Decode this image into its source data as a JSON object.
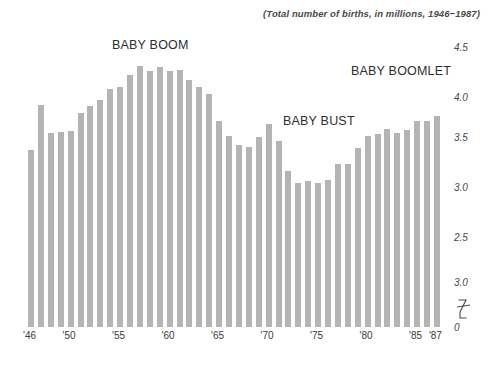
{
  "chart_data": {
    "type": "bar",
    "title": "",
    "subtitle": "(Total number of births, in millions, 1946−1987)",
    "xlabel": "",
    "ylabel": "",
    "ylim": [
      0,
      4.5
    ],
    "grid": false,
    "legend": null,
    "bar_color": "#b4b4b4",
    "background_color": "#ffffff",
    "axis_note": "y-axis is broken below the lowest labelled tick; the tick printed directly above the break reads '3.0' as rendered",
    "categories": [
      "1946",
      "1947",
      "1948",
      "1949",
      "1950",
      "1951",
      "1952",
      "1953",
      "1954",
      "1955",
      "1956",
      "1957",
      "1958",
      "1959",
      "1960",
      "1961",
      "1962",
      "1963",
      "1964",
      "1965",
      "1966",
      "1967",
      "1968",
      "1969",
      "1970",
      "1971",
      "1972",
      "1973",
      "1974",
      "1975",
      "1976",
      "1977",
      "1978",
      "1979",
      "1980",
      "1981",
      "1982",
      "1983",
      "1984",
      "1985",
      "1986",
      "1987"
    ],
    "values": [
      3.47,
      3.92,
      3.64,
      3.65,
      3.66,
      3.84,
      3.91,
      3.97,
      4.08,
      4.1,
      4.22,
      4.31,
      4.26,
      4.3,
      4.26,
      4.27,
      4.17,
      4.1,
      4.03,
      3.76,
      3.61,
      3.52,
      3.5,
      3.6,
      3.73,
      3.56,
      3.26,
      3.14,
      3.16,
      3.14,
      3.17,
      3.33,
      3.33,
      3.49,
      3.61,
      3.63,
      3.68,
      3.64,
      3.67,
      3.76,
      3.76,
      3.81
    ],
    "annotations": [
      {
        "text": "BABY BOOM",
        "near_category": "1957"
      },
      {
        "text": "BABY BUST",
        "near_category": "1975"
      },
      {
        "text": "BABY BOOMLET",
        "near_category": "1985"
      }
    ],
    "y_ticks": [
      {
        "label": "4.5",
        "value": 4.5
      },
      {
        "label": "4.0",
        "value": 4.0
      },
      {
        "label": "3.5",
        "value": 3.5
      },
      {
        "label": "3.0",
        "value": 3.0
      },
      {
        "label": "2.5",
        "value": 2.5
      },
      {
        "label": "3.0",
        "value": 2.0
      },
      {
        "label": "0",
        "value": 0.0
      }
    ],
    "x_ticks": [
      {
        "label": "'46",
        "category": "1946"
      },
      {
        "label": "'50",
        "category": "1950"
      },
      {
        "label": "'55",
        "category": "1955"
      },
      {
        "label": "'60",
        "category": "1960"
      },
      {
        "label": "'65",
        "category": "1965"
      },
      {
        "label": "'70",
        "category": "1970"
      },
      {
        "label": "'75",
        "category": "1975"
      },
      {
        "label": "'80",
        "category": "1980"
      },
      {
        "label": "'85",
        "category": "1985"
      },
      {
        "label": "'87",
        "category": "1987"
      }
    ]
  }
}
